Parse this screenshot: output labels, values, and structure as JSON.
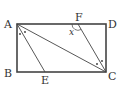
{
  "diagram": {
    "type": "geometry-rectangle",
    "points": {
      "A": {
        "label": "A",
        "x": 17,
        "y": 24
      },
      "D": {
        "label": "D",
        "x": 106,
        "y": 24
      },
      "B": {
        "label": "B",
        "x": 17,
        "y": 72
      },
      "C": {
        "label": "C",
        "x": 106,
        "y": 72
      },
      "E": {
        "label": "E",
        "x": 45,
        "y": 72
      },
      "F": {
        "label": "F",
        "x": 78,
        "y": 24
      }
    },
    "segments": [
      "AB",
      "BC",
      "CD",
      "DA",
      "AC",
      "AE",
      "CF"
    ],
    "angle_label": "x",
    "angle_marks": "equal-angle dots at A (BAE, EAC) and at C (ACF, FCD)"
  }
}
